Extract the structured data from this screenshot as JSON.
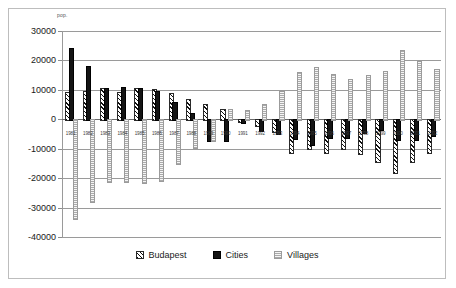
{
  "chart_data": {
    "type": "bar",
    "title": "",
    "subtitle": "",
    "xlabel": "",
    "ylabel": "pop.",
    "ylim": [
      -40000,
      30000
    ],
    "ytick_step": 10000,
    "yticks": [
      30000,
      20000,
      10000,
      0,
      -10000,
      -20000,
      -30000,
      -40000
    ],
    "ytick_labels": [
      "30000",
      "20000",
      "10000",
      "0",
      "-10000",
      "-20000",
      "-30000",
      "-40000"
    ],
    "grid": true,
    "legend_position": "bottom",
    "categories": [
      "1981",
      "1982",
      "1983",
      "1984",
      "1985",
      "1986",
      "1987",
      "1988",
      "1989",
      "1990",
      "1991",
      "1992",
      "1993",
      "1994",
      "1995",
      "1996",
      "1997",
      "1998",
      "1999",
      "2000",
      "2001",
      "2002"
    ],
    "series": [
      {
        "name": "Budapest",
        "pattern": "diagonal-hatch",
        "color": "#1a1a1a",
        "values": [
          9400,
          9600,
          10700,
          9400,
          10600,
          10400,
          8800,
          7000,
          5300,
          3600,
          -600,
          -2100,
          -4100,
          -11000,
          -9800,
          -11000,
          -9600,
          -11400,
          -14300,
          -17800,
          -14100,
          -11000
        ]
      },
      {
        "name": "Cities",
        "pattern": "solid",
        "color": "#141414",
        "values": [
          24100,
          18100,
          10800,
          10900,
          10700,
          9700,
          6000,
          2200,
          -6900,
          -6900,
          -1000,
          -3500,
          -4700,
          -6400,
          -8500,
          -6000,
          -6000,
          -4400,
          -3300,
          -6600,
          -6700,
          -5300
        ]
      },
      {
        "name": "Villages",
        "pattern": "fine-dotted",
        "color": "#dcdcdc",
        "values": [
          -33400,
          -27600,
          -21000,
          -21000,
          -21300,
          -20600,
          -15000,
          -9300,
          -7000,
          3600,
          3000,
          5300,
          9600,
          16000,
          17900,
          15500,
          13700,
          15200,
          16400,
          23400,
          19800,
          17100
        ]
      }
    ]
  },
  "legend": {
    "items": [
      {
        "label": "Budapest"
      },
      {
        "label": "Cities"
      },
      {
        "label": "Villages"
      }
    ]
  }
}
